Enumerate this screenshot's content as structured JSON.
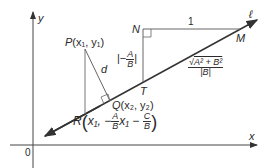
{
  "diagram": {
    "axes": {
      "x_label": "x",
      "y_label": "y",
      "origin_label": "0"
    },
    "line": {
      "label": "ℓ"
    },
    "points": {
      "P": {
        "name": "P",
        "coords": "(x₁, y₁)"
      },
      "Q": {
        "name": "Q",
        "coords": "(x₂, y₂)"
      },
      "R": {
        "name": "R",
        "arg1": "x₁,",
        "minus": "−",
        "A": "A",
        "B": "B",
        "x1": "x₁",
        "C": "C"
      },
      "N": {
        "name": "N"
      },
      "M": {
        "name": "M"
      },
      "T": {
        "name": "T"
      }
    },
    "labels": {
      "distance": "d",
      "nm_length": "1",
      "nt_num": "A",
      "nt_den": "B",
      "tm_num": "A² + B²",
      "tm_den": "|B|"
    },
    "colors": {
      "stroke": "#333333",
      "thin_stroke": "#666666"
    }
  }
}
